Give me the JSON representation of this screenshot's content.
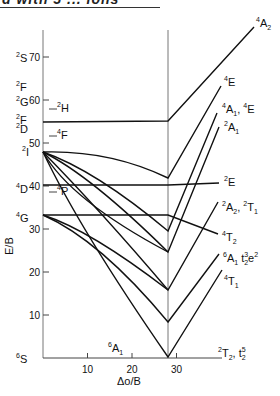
{
  "header": {
    "partial_title": "d with 5 ... ions"
  },
  "chart_data": {
    "type": "line",
    "xlabel": "Δo/B",
    "ylabel": "E/B",
    "xlim": [
      0,
      38
    ],
    "ylim": [
      0,
      78
    ],
    "x_ticks": [
      10,
      20,
      30
    ],
    "y_ticks": [
      10,
      20,
      30,
      40,
      50,
      60,
      70
    ],
    "crossover_x": 28,
    "free_ion_terms": [
      {
        "sup": "2",
        "term": "S",
        "E": 70
      },
      {
        "sup": "2",
        "term": "F",
        "E": 62
      },
      {
        "sup": "2",
        "term": "G",
        "E": 59
      },
      {
        "sup": "2",
        "term": "H",
        "E": 56
      },
      {
        "sup": "2",
        "term": "F",
        "E": 55
      },
      {
        "sup": "2",
        "term": "D",
        "E": 53
      },
      {
        "sup": "4",
        "term": "F",
        "E": 51
      },
      {
        "sup": "2",
        "term": "I",
        "E": 48
      },
      {
        "sup": "4",
        "term": "D",
        "E": 40
      },
      {
        "sup": "4",
        "term": "P",
        "E": 38
      },
      {
        "sup": "4",
        "term": "G",
        "E": 33
      },
      {
        "sup": "6",
        "term": "S",
        "E": 0
      }
    ],
    "right_labels": [
      {
        "text": "4A2",
        "y_px": 27
      },
      {
        "text": "4E",
        "y_px": 86
      },
      {
        "text": "4A1, 4E",
        "y_px": 112
      },
      {
        "text": "2A1",
        "y_px": 130
      },
      {
        "text": "2E",
        "y_px": 184
      },
      {
        "text": "2A2, 2T1",
        "y_px": 210
      },
      {
        "text": "4T2",
        "y_px": 240
      },
      {
        "text": "6A1  t2^3 e^2",
        "y_px": 262
      },
      {
        "text": "4T1",
        "y_px": 285
      },
      {
        "text": "2T2, t2^5",
        "y_px": 356
      }
    ],
    "inline_label": {
      "text": "6A1",
      "x": 15,
      "E": 5
    },
    "series": [
      {
        "name": "2F→4A2",
        "points": [
          [
            0,
            55
          ],
          [
            28,
            55
          ],
          [
            38,
            78
          ]
        ]
      },
      {
        "name": "2I→4E",
        "points": [
          [
            0,
            48
          ],
          [
            10,
            47
          ],
          [
            20,
            44
          ],
          [
            28,
            42
          ],
          [
            34,
            63
          ]
        ]
      },
      {
        "name": "2I→4A1,4E",
        "points": [
          [
            0,
            48
          ],
          [
            28,
            29.5
          ],
          [
            33,
            56
          ]
        ]
      },
      {
        "name": "2I→2A1",
        "points": [
          [
            0,
            48
          ],
          [
            28,
            24.5
          ],
          [
            33,
            53
          ]
        ]
      },
      {
        "name": "4D→2E",
        "points": [
          [
            0,
            40
          ],
          [
            28,
            40
          ],
          [
            33,
            41
          ]
        ]
      },
      {
        "name": "2I→2A2,2T1",
        "points": [
          [
            0,
            48
          ],
          [
            28,
            15.5
          ],
          [
            33,
            35
          ]
        ]
      },
      {
        "name": "4G→4T2",
        "points": [
          [
            0,
            33
          ],
          [
            28,
            33
          ],
          [
            33,
            28
          ]
        ]
      },
      {
        "name": "4G→4T1",
        "points": [
          [
            0,
            33
          ],
          [
            28,
            8
          ],
          [
            33,
            17
          ]
        ]
      },
      {
        "name": "6S→6A1",
        "points": [
          [
            0,
            0
          ],
          [
            28,
            0
          ],
          [
            33,
            22
          ]
        ]
      },
      {
        "name": "4G curve",
        "points": [
          [
            0,
            33
          ],
          [
            28,
            15.5
          ]
        ]
      },
      {
        "name": "2I→2T2",
        "points": [
          [
            0,
            48
          ],
          [
            28,
            0
          ]
        ]
      }
    ]
  },
  "axis": {
    "y_label": "E/B",
    "x_label": "Δo/B",
    "x_ticks": [
      "10",
      "20",
      "30"
    ],
    "y_ticks": [
      "10",
      "20",
      "30",
      "40",
      "50",
      "60",
      "70"
    ]
  }
}
